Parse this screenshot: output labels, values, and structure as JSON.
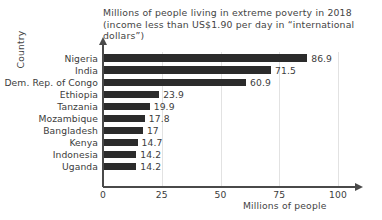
{
  "chart_data": {
    "type": "bar",
    "orientation": "horizontal",
    "title": "Millions of people living in extreme poverty in 2018\n(income less than US$1.90 per day in “international dollars”)",
    "title_line1": "Millions of people living in extreme poverty in 2018",
    "title_line2": "(income less than US$1.90 per day in “international dollars”)",
    "xlabel": "Millions of people",
    "ylabel": "Country",
    "xlim": [
      0,
      100
    ],
    "xticks": [
      "0",
      "25",
      "50",
      "75",
      "100"
    ],
    "xtick_values": [
      0,
      25,
      50,
      75,
      100
    ],
    "grid": "vertical",
    "legend": "none",
    "bar_color": "#2b2b2b",
    "categories": [
      "Nigeria",
      "India",
      "Dem. Rep. of Congo",
      "Ethiopia",
      "Tanzania",
      "Mozambique",
      "Bangladesh",
      "Kenya",
      "Indonesia",
      "Uganda"
    ],
    "values": [
      86.9,
      71.5,
      60.9,
      23.9,
      19.9,
      17.8,
      17,
      14.7,
      14.2,
      14.2
    ],
    "value_labels": [
      "86.9",
      "71.5",
      "60.9",
      "23.9",
      "19.9",
      "17.8",
      "17",
      "14.7",
      "14.2",
      "14.2"
    ]
  }
}
